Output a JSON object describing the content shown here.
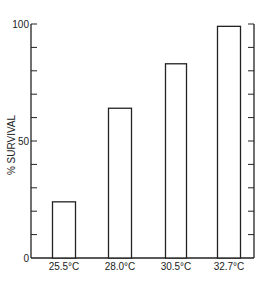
{
  "chart_data": {
    "type": "bar",
    "title": "",
    "xlabel": "",
    "ylabel": "% SURVIVAL",
    "categories": [
      "25.5°C",
      "28.0°C",
      "30.5°C",
      "32.7°C"
    ],
    "values": [
      24,
      64,
      83,
      99
    ],
    "ylim": [
      0,
      100
    ],
    "yticks_labeled": [
      0,
      50,
      100
    ],
    "minor_tick_step": 10,
    "grid": false,
    "legend": null,
    "bar_style": "outline",
    "colors": {
      "stroke": "#222222",
      "fill": "#ffffff"
    }
  }
}
